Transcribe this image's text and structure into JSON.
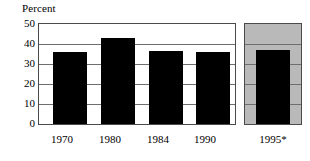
{
  "chart_data": {
    "type": "bar",
    "title": "Percent",
    "xlabel": "",
    "ylabel": "Percent",
    "categories": [
      "1970",
      "1980",
      "1984",
      "1990",
      "1995*"
    ],
    "values": [
      36,
      43,
      36.5,
      36,
      37
    ],
    "ylim": [
      0,
      50
    ],
    "yticks": [
      0,
      10,
      20,
      30,
      40,
      50
    ],
    "ytick_labels": [
      "0",
      "10",
      "20",
      "30",
      "40",
      "50"
    ],
    "grid": true,
    "legend": false,
    "colors": {
      "bar": "#000000",
      "panel_background": "#ffffff",
      "forecast_panel_background": "#b9b9b9",
      "frame": "#4a4a4a",
      "gridline": "#6e6e6e",
      "text": "#000000"
    },
    "panels": [
      {
        "name": "observed",
        "categories": [
          "1970",
          "1980",
          "1984",
          "1990"
        ]
      },
      {
        "name": "projected",
        "categories": [
          "1995*"
        ]
      }
    ]
  }
}
